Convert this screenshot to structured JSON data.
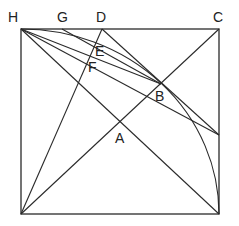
{
  "diagram": {
    "type": "geometric-construction",
    "points": {
      "H": {
        "label": "H",
        "x": 21,
        "y": 29
      },
      "G": {
        "label": "G",
        "x": 62,
        "y": 29
      },
      "D": {
        "label": "D",
        "x": 102,
        "y": 29
      },
      "C": {
        "label": "C",
        "x": 219,
        "y": 29
      },
      "E": {
        "label": "E",
        "x": 97,
        "y": 47
      },
      "F": {
        "label": "F",
        "x": 93,
        "y": 62
      },
      "B": {
        "label": "B",
        "x": 161,
        "y": 84
      },
      "A": {
        "label": "A",
        "x": 120,
        "y": 122
      },
      "BL": {
        "label": "",
        "x": 21,
        "y": 214
      },
      "BR": {
        "label": "",
        "x": 219,
        "y": 214
      }
    },
    "labels": {
      "H": "H",
      "G": "G",
      "D": "D",
      "C": "C",
      "E": "E",
      "F": "F",
      "B": "B",
      "A": "A"
    },
    "colors": {
      "line": "#2a2a2a",
      "background": "#ffffff"
    }
  }
}
